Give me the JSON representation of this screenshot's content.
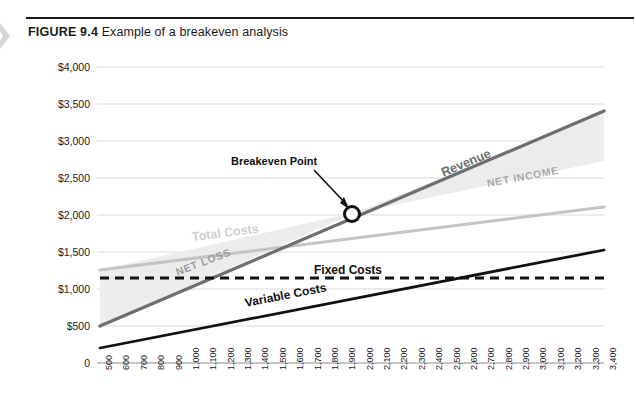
{
  "figure": {
    "number_label": "FIGURE 9.4",
    "caption": "Example of a breakeven analysis"
  },
  "icons": {
    "chevron": "chevron-right-icon"
  },
  "chart_data": {
    "type": "line",
    "title": "Example of a breakeven analysis",
    "xlabel": "",
    "ylabel": "",
    "xlim": [
      500,
      3400
    ],
    "ylim": [
      0,
      4000
    ],
    "grid": true,
    "legend": "inline-labels",
    "x_ticks": [
      "500",
      "600",
      "700",
      "800",
      "900",
      "1,000",
      "1,100",
      "1,200",
      "1,300",
      "1,400",
      "1,500",
      "1,600",
      "1,700",
      "1,800",
      "1,900",
      "2,000",
      "2,100",
      "2,200",
      "2,300",
      "2,400",
      "2,500",
      "2,600",
      "2,700",
      "2,800",
      "2,900",
      "3,000",
      "3,100",
      "3,200",
      "3,300",
      "3,400"
    ],
    "y_ticks": [
      "0",
      "$500",
      "$1,000",
      "$1,500",
      "$2,000",
      "$2,500",
      "$3,000",
      "$3,500",
      "$4,000"
    ],
    "y_tick_values": [
      0,
      500,
      1000,
      1500,
      2000,
      2500,
      3000,
      3500,
      4000
    ],
    "series": [
      {
        "name": "Revenue",
        "label": "Revenue",
        "color": "#6e6e6e",
        "style": "solid",
        "x": [
          500,
          3400
        ],
        "values": [
          500,
          3400
        ]
      },
      {
        "name": "Total Costs",
        "label": "Total Costs",
        "color": "#c4c4c4",
        "style": "solid",
        "x": [
          500,
          3400
        ],
        "values": [
          1250,
          2105
        ]
      },
      {
        "name": "Fixed Costs",
        "label": "Fixed Costs",
        "color": "#111111",
        "style": "dashed",
        "x": [
          500,
          3400
        ],
        "values": [
          1150,
          1150
        ]
      },
      {
        "name": "Variable Costs",
        "label": "Variable Costs",
        "color": "#111111",
        "style": "solid",
        "x": [
          500,
          3400
        ],
        "values": [
          200,
          1530
        ]
      }
    ],
    "regions": [
      {
        "name": "NET LOSS",
        "label": "NET LOSS",
        "fill": "#ececec",
        "x_range": [
          500,
          2000
        ]
      },
      {
        "name": "NET INCOME",
        "label": "NET INCOME",
        "fill": "#ececec",
        "x_range": [
          2000,
          3400
        ]
      }
    ],
    "annotations": [
      {
        "name": "breakeven-point",
        "label": "Breakeven Point",
        "x": 2000,
        "y": 2000,
        "marker": "circle"
      }
    ]
  }
}
